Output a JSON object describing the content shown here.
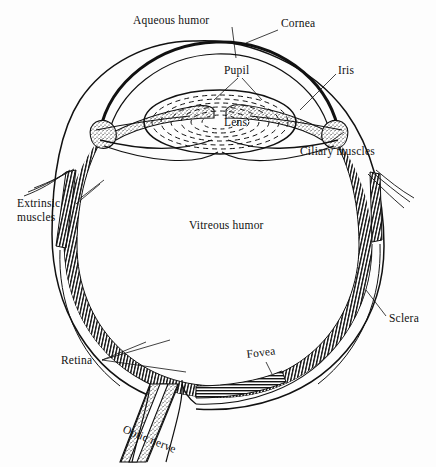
{
  "figure": {
    "background_color": "#fdfdfd",
    "ink_color": "#111111",
    "width": 436,
    "height": 467
  },
  "labels": {
    "aqueous_humor": "Aqueous humor",
    "cornea": "Cornea",
    "pupil": "Pupil",
    "iris": "Iris",
    "lens": "Lens",
    "ciliary_muscles": "Ciliary muscles",
    "extrinsic_line1": "Extrinsic",
    "extrinsic_line2": "muscles",
    "vitreous_humor": "Vitreous humor",
    "sclera": "Sclera",
    "retina": "Retina",
    "fovea": "Fovea",
    "optic_nerve": "Optic nerve"
  },
  "structures": [
    {
      "name": "cornea",
      "description": "thick transparent dome at top of globe"
    },
    {
      "name": "aqueous-humor",
      "description": "chamber between cornea and lens"
    },
    {
      "name": "iris",
      "description": "stippled wedge flanking the pupil"
    },
    {
      "name": "pupil",
      "description": "aperture between the two iris leaves"
    },
    {
      "name": "lens",
      "description": "biconvex body with concentric dashed fibre rings"
    },
    {
      "name": "ciliary-muscles",
      "description": "nodules at the lens equator"
    },
    {
      "name": "vitreous-humor",
      "description": "large clear interior of the globe"
    },
    {
      "name": "retina",
      "description": "hatched inner lining of the posterior globe"
    },
    {
      "name": "sclera",
      "description": "outer coat drawn as the outermost arc"
    },
    {
      "name": "fovea",
      "description": "notch in the retina at the posterior pole"
    },
    {
      "name": "optic-nerve",
      "description": "stippled bundle leaving the globe toward lower left"
    },
    {
      "name": "extrinsic-muscles",
      "description": "tendon strips attaching to the globe on both sides"
    }
  ]
}
